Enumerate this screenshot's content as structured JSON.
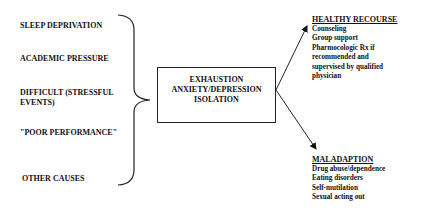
{
  "causes": [
    "SLEEP DEPRIVATION",
    "ACADEMIC PRESSURE",
    "DIFFICULT (STRESSFUL",
    "EVENTS)",
    "\"POOR PERFORMANCE\"",
    "OTHER CAUSES"
  ],
  "center_box": {
    "lines": [
      "EXHAUSTION",
      "ANXIETY/DEPRESSION",
      "ISOLATION"
    ]
  },
  "healthy": {
    "title": "HEALTHY RECOURSE",
    "items": [
      "Counseling",
      "Group support",
      "Pharmocologic Rx if",
      "recommended and",
      "supervised by qualified",
      "physician"
    ]
  },
  "maladaption": {
    "title": "MALADAPTION",
    "items": [
      "Drug abuse/dependence",
      "Eating disorders",
      "Self-mutilation",
      "Sexual acting out"
    ]
  }
}
